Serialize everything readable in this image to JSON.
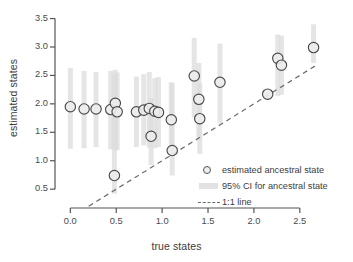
{
  "chart_data": {
    "type": "scatter",
    "title": "",
    "xlabel": "true states",
    "ylabel": "estimated states",
    "xlim": [
      -0.08,
      2.72
    ],
    "ylim": [
      0.38,
      3.58
    ],
    "xticks": [
      "0.0",
      "0.5",
      "1.0",
      "1.5",
      "2.0",
      "2.5"
    ],
    "xtick_values": [
      0.0,
      0.5,
      1.0,
      1.5,
      2.0,
      2.5
    ],
    "yticks": [
      "0.5",
      "1.0",
      "1.5",
      "2.0",
      "2.5",
      "3.0",
      "3.5"
    ],
    "ytick_values": [
      0.5,
      1.0,
      1.5,
      2.0,
      2.5,
      3.0,
      3.5
    ],
    "grid": false,
    "legend_position": "lower-right",
    "reference_line": {
      "label": "1:1 line",
      "style": "dashed",
      "slope": 1,
      "intercept": 0,
      "x_start": 0.2,
      "x_end": 2.68,
      "color": "#6e6e6e"
    },
    "marker": {
      "shape": "circle",
      "fill": "#ececec",
      "edge": "#4a4a4a",
      "radius_px": 5.2
    },
    "ci_band": {
      "color": "#dcdcdc",
      "width_px": 5,
      "label": "95% CI for ancestral state"
    },
    "points": [
      {
        "x": 0.0,
        "y": 1.95,
        "ci_low": 1.21,
        "ci_high": 2.63
      },
      {
        "x": 0.15,
        "y": 1.91,
        "ci_low": 1.22,
        "ci_high": 2.58
      },
      {
        "x": 0.28,
        "y": 1.91,
        "ci_low": 1.24,
        "ci_high": 2.56
      },
      {
        "x": 0.44,
        "y": 1.9,
        "ci_low": 1.2,
        "ci_high": 2.58
      },
      {
        "x": 0.49,
        "y": 2.01,
        "ci_low": 1.18,
        "ci_high": 2.6
      },
      {
        "x": 0.51,
        "y": 1.86,
        "ci_low": 1.19,
        "ci_high": 2.55
      },
      {
        "x": 0.48,
        "y": 0.74,
        "ci_low": 0.42,
        "ci_high": 2.52
      },
      {
        "x": 0.72,
        "y": 1.86,
        "ci_low": 1.24,
        "ci_high": 2.48
      },
      {
        "x": 0.8,
        "y": 1.89,
        "ci_low": 1.27,
        "ci_high": 2.52
      },
      {
        "x": 0.86,
        "y": 1.92,
        "ci_low": 1.23,
        "ci_high": 2.56
      },
      {
        "x": 0.92,
        "y": 1.87,
        "ci_low": 1.22,
        "ci_high": 2.45
      },
      {
        "x": 0.96,
        "y": 1.85,
        "ci_low": 1.24,
        "ci_high": 2.47
      },
      {
        "x": 0.88,
        "y": 1.43,
        "ci_low": 0.92,
        "ci_high": 2.1
      },
      {
        "x": 1.1,
        "y": 1.72,
        "ci_low": 1.18,
        "ci_high": 2.38
      },
      {
        "x": 1.11,
        "y": 1.18,
        "ci_low": 0.74,
        "ci_high": 2.36
      },
      {
        "x": 1.35,
        "y": 2.49,
        "ci_low": 1.76,
        "ci_high": 3.16
      },
      {
        "x": 1.4,
        "y": 2.08,
        "ci_low": 1.42,
        "ci_high": 2.72
      },
      {
        "x": 1.41,
        "y": 1.74,
        "ci_low": 1.12,
        "ci_high": 2.36
      },
      {
        "x": 1.63,
        "y": 2.38,
        "ci_low": 1.66,
        "ci_high": 3.06
      },
      {
        "x": 2.15,
        "y": 2.17,
        "ci_low": 2.17,
        "ci_high": 2.17
      },
      {
        "x": 2.26,
        "y": 2.8,
        "ci_low": 2.14,
        "ci_high": 3.22
      },
      {
        "x": 2.3,
        "y": 2.68,
        "ci_low": 2.16,
        "ci_high": 3.2
      },
      {
        "x": 2.65,
        "y": 2.99,
        "ci_low": 2.72,
        "ci_high": 3.4
      }
    ],
    "legend_entries": [
      {
        "label": "estimated ancestral state",
        "marker": "circle"
      },
      {
        "label": "95% CI for ancestral state",
        "marker": "band"
      },
      {
        "label": "1:1 line",
        "marker": "dashed-line"
      }
    ]
  }
}
